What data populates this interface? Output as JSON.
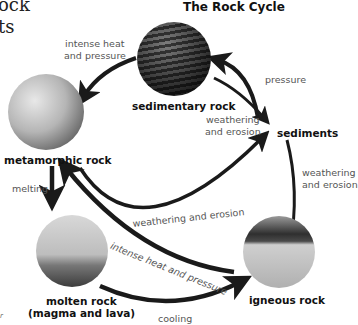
{
  "page_fragments": {
    "line1": "ock",
    "line2": "ts",
    "page_mark": "r"
  },
  "diagram": {
    "title": "The Rock Cycle",
    "nodes": {
      "sedimentary": "sedimentary rock",
      "sediments": "sediments",
      "metamorphic": "metamorphic rock",
      "molten_line1": "molten rock",
      "molten_line2": "(magma and lava)",
      "igneous": "igneous rock"
    },
    "processes": {
      "sed_to_meta_1": "intense heat",
      "sed_to_meta_2": "and pressure",
      "sediments_to_sed": "pressure",
      "sed_to_sediments_1": "weathering",
      "sed_to_sediments_2": "and erosion",
      "igneous_to_sediments_1": "weathering",
      "igneous_to_sediments_2": "and erosion",
      "meta_to_melting": "melting",
      "meta_to_sediments": "weathering and erosion",
      "igneous_to_meta": "intense heat and pressure",
      "molten_to_igneous": "cooling"
    },
    "colors": {
      "arrow": "#1a1a1a",
      "process_text": "#555555",
      "node_text": "#111111"
    }
  }
}
